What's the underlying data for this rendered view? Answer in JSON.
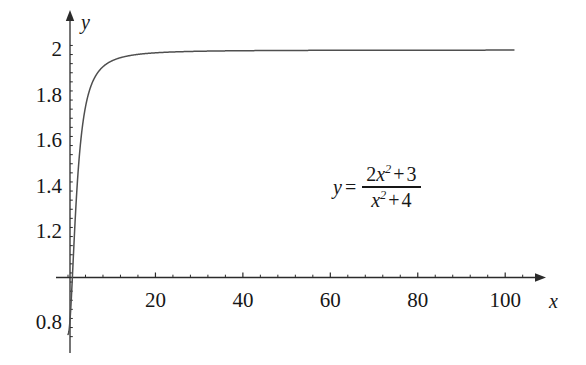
{
  "chart_data": {
    "type": "line",
    "title": "",
    "subtitle": "",
    "xlabel": "x",
    "ylabel": "y",
    "annotation": "y = (2x^2 + 3) / (x^2 + 4)",
    "equation": {
      "lhs": "y",
      "equals": "=",
      "numerator": {
        "coefficient": "2",
        "variable": "x",
        "exponent": "2",
        "operator": "+",
        "constant": "3"
      },
      "denominator": {
        "variable": "x",
        "exponent": "2",
        "operator": "+",
        "constant": "4"
      }
    },
    "grid": false,
    "legend": null,
    "xlim": [
      0,
      110
    ],
    "ylim": [
      0.74,
      2.06
    ],
    "x_axis_line_at_y": 1.0,
    "y_axis_line_at_x": 0,
    "xticks": [
      20,
      40,
      60,
      80,
      100
    ],
    "xtick_labels": [
      "20",
      "40",
      "60",
      "80",
      "100"
    ],
    "x_minor_ticks_between": 4,
    "yticks": [
      2,
      1.8,
      1.6,
      1.4,
      1.2,
      0.8
    ],
    "ytick_labels": [
      "2",
      "1.8",
      "1.6",
      "1.4",
      "1.2",
      "0.8"
    ],
    "y_minor_ticks_between": 4,
    "series": [
      {
        "name": "y = (2x^2 + 3)/(x^2 + 4)",
        "color": "#4a4a4a",
        "x": [
          0,
          0.25,
          0.5,
          0.75,
          1,
          1.25,
          1.5,
          1.75,
          2,
          2.5,
          3,
          3.5,
          4,
          4.5,
          5,
          6,
          7,
          8,
          9,
          10,
          12,
          14,
          16,
          18,
          20,
          25,
          30,
          35,
          40,
          50,
          60,
          70,
          80,
          90,
          100,
          110
        ],
        "y": [
          0.75,
          0.771,
          0.833,
          0.934,
          1.0,
          1.191,
          1.32,
          1.452,
          1.575,
          1.779,
          1.923,
          2.022,
          2.15,
          2.185,
          2.241,
          2.295,
          2.34,
          2.375,
          2.402,
          2.423,
          2.455,
          2.474,
          2.487,
          2.496,
          2.502,
          2.513,
          2.518,
          2.521,
          2.523,
          2.525,
          2.526,
          2.527,
          2.527,
          2.527,
          2.528,
          2.528
        ],
        "y_actual": [
          0.75,
          0.777,
          0.847,
          0.946,
          1.0,
          1.12,
          1.22,
          1.31,
          1.375,
          1.51,
          1.615,
          1.69,
          1.75,
          1.8,
          1.83,
          1.875,
          1.91,
          1.925,
          1.94,
          1.95,
          1.96,
          1.97,
          1.975,
          1.98,
          1.985,
          1.99,
          1.993,
          1.994,
          1.995,
          1.997,
          1.998,
          1.998,
          1.999,
          1.999,
          1.999,
          1.999
        ]
      }
    ],
    "function": {
      "expression": "(2*x*x + 3) / (x*x + 4)",
      "domain_start": 0,
      "domain_end": 102,
      "samples": 900
    },
    "axis_arrows": {
      "x": true,
      "y": true
    }
  },
  "geometry": {
    "width": 586,
    "height": 365,
    "x_origin_px": 68,
    "x_scale_px_per_unit": 4.372,
    "y_axis_px": 70,
    "y_value_at_axis_line": 1.0,
    "y_axis_line_px": 277.5,
    "y_scale_px_per_unit": 227.5,
    "x_axis_left_px": 56,
    "x_axis_right_px": 546,
    "y_axis_top_px": 10,
    "y_axis_bottom_px": 353,
    "curve_clip_right_px": 516
  },
  "style": {
    "background": "#ffffff",
    "axis_color": "#2b2b2b",
    "curve_color": "#4f4f4f",
    "text_color": "#171717"
  }
}
